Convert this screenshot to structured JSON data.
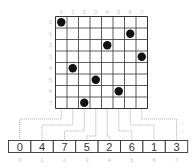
{
  "board": {
    "size": 8,
    "column_labels": [
      "0",
      "1",
      "2",
      "3",
      "4",
      "5",
      "6",
      "7"
    ],
    "row_labels": [
      "0",
      "1",
      "2",
      "3",
      "4",
      "5",
      "6",
      "7"
    ],
    "queens": [
      {
        "row": 0,
        "col": 0
      },
      {
        "row": 1,
        "col": 6
      },
      {
        "row": 2,
        "col": 4
      },
      {
        "row": 3,
        "col": 7
      },
      {
        "row": 4,
        "col": 1
      },
      {
        "row": 5,
        "col": 3
      },
      {
        "row": 6,
        "col": 5
      },
      {
        "row": 7,
        "col": 2
      }
    ]
  },
  "array": {
    "values": [
      "0",
      "4",
      "7",
      "5",
      "2",
      "6",
      "1",
      "3"
    ],
    "indices": [
      "0",
      "1",
      "2",
      "3",
      "4",
      "5",
      "6",
      "7"
    ]
  },
  "colors": {
    "grid_line": "#333333",
    "queen": "#111111",
    "label": "#c8c8c8",
    "connector": "#999999"
  }
}
